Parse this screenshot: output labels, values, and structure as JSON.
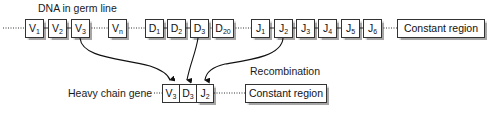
{
  "title": "DNA in germ line",
  "germline": {
    "segments": [
      {
        "id": "V1",
        "base": "V",
        "sub": "1",
        "x": 25,
        "w": 17
      },
      {
        "id": "V2",
        "base": "V",
        "sub": "2",
        "x": 48,
        "w": 17
      },
      {
        "id": "V3",
        "base": "V",
        "sub": "3",
        "x": 71,
        "w": 17
      },
      {
        "id": "Vn",
        "base": "V",
        "sub": "n",
        "x": 108,
        "w": 17
      },
      {
        "id": "D1",
        "base": "D",
        "sub": "1",
        "x": 145,
        "w": 17
      },
      {
        "id": "D2",
        "base": "D",
        "sub": "2",
        "x": 167,
        "w": 17
      },
      {
        "id": "D3",
        "base": "D",
        "sub": "3",
        "x": 190,
        "w": 17
      },
      {
        "id": "D20",
        "base": "D",
        "sub": "20",
        "x": 212,
        "w": 20
      },
      {
        "id": "J1",
        "base": "J",
        "sub": "1",
        "x": 251,
        "w": 17
      },
      {
        "id": "J2",
        "base": "J",
        "sub": "2",
        "x": 274,
        "w": 17
      },
      {
        "id": "J3",
        "base": "J",
        "sub": "3",
        "x": 296,
        "w": 17
      },
      {
        "id": "J4",
        "base": "J",
        "sub": "4",
        "x": 318,
        "w": 17
      },
      {
        "id": "J5",
        "base": "J",
        "sub": "5",
        "x": 341,
        "w": 17
      },
      {
        "id": "J6",
        "base": "J",
        "sub": "6",
        "x": 363,
        "w": 17
      }
    ],
    "constant_region": "Constant region"
  },
  "recombination_label": "Recombination",
  "heavy_chain": {
    "label": "Heavy chain gene",
    "segments": [
      {
        "id": "V3",
        "base": "V",
        "sub": "3"
      },
      {
        "id": "D3",
        "base": "D",
        "sub": "3"
      },
      {
        "id": "J2",
        "base": "J",
        "sub": "2"
      }
    ],
    "constant_region": "Constant region"
  }
}
